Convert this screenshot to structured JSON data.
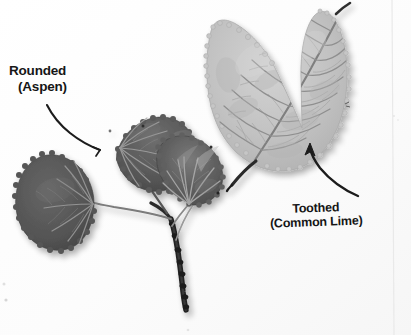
{
  "figure": {
    "background_color": "#fdfdfd",
    "width": 411,
    "height": 335
  },
  "annotations": [
    {
      "id": "rounded-aspen",
      "line1": "Rounded",
      "line2": "(Aspen)",
      "text_color": "#161616",
      "pointer": "curved-leader-line",
      "points_to": "aspen-leaf-upper-left"
    },
    {
      "id": "toothed-common-lime",
      "line1": "Toothed",
      "line2": "(Common Lime)",
      "text_color": "#161616",
      "pointer": "curved-arrow",
      "points_to": "lime-leaf-margin"
    }
  ],
  "specimens": [
    {
      "id": "aspen-sprig",
      "common_name": "Aspen",
      "margin_type": "Rounded",
      "leaf_count": 3,
      "tone": "#5a5a5a",
      "description": "Three dark rounded leaves on a knobby twig"
    },
    {
      "id": "common-lime-leaf",
      "common_name": "Common Lime",
      "margin_type": "Toothed",
      "leaf_count": 1,
      "tone": "#bcbcbc",
      "description": "Large pale heart-shaped leaf with serrated margin"
    }
  ],
  "colors": {
    "background": "#fdfdfd",
    "aspen_dark": "#4e4e4e",
    "aspen_mid": "#626262",
    "aspen_vein": "#9a9a9a",
    "lime_pale": "#c2c2c2",
    "lime_vein": "#8c8c8c",
    "twig": "#2b2b2b",
    "ink": "#161616"
  }
}
